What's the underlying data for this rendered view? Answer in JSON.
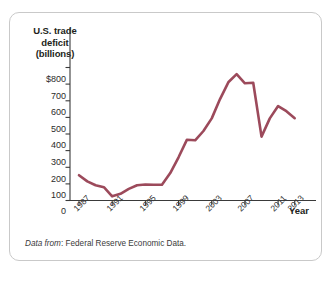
{
  "figure": {
    "source_note_prefix": "Data from",
    "source_note_sep": ":",
    "source_note_body": "Federal Reserve Economic Data."
  },
  "chart_data": {
    "type": "line",
    "title": "",
    "ylabel_lines": [
      "U.S. trade",
      "deficit",
      "(billions)"
    ],
    "ylabel": "U.S. trade deficit (billions)",
    "xlabel": "Year",
    "ylim": [
      0,
      800
    ],
    "xlim": [
      1987,
      2013
    ],
    "grid": false,
    "legend": "none",
    "line_color": "#9c4a5b",
    "ytick_labels": [
      "$800",
      "700",
      "600",
      "500",
      "400",
      "300",
      "200",
      "100",
      "0"
    ],
    "ytick_values": [
      800,
      700,
      600,
      500,
      400,
      300,
      200,
      100,
      0
    ],
    "xtick_labels": [
      "1987",
      "1991",
      "1995",
      "1999",
      "2003",
      "2007",
      "2011",
      "2013"
    ],
    "xtick_values": [
      1987,
      1991,
      1995,
      1999,
      2003,
      2007,
      2011,
      2013
    ],
    "x": [
      1987,
      1988,
      1989,
      1990,
      1991,
      1992,
      1993,
      1994,
      1995,
      1996,
      1997,
      1998,
      1999,
      2000,
      2001,
      2002,
      2003,
      2004,
      2005,
      2006,
      2007,
      2008,
      2009,
      2010,
      2011,
      2012,
      2013
    ],
    "values": [
      152,
      115,
      92,
      80,
      25,
      40,
      70,
      92,
      96,
      95,
      95,
      165,
      260,
      365,
      362,
      418,
      494,
      610,
      711,
      760,
      705,
      708,
      384,
      494,
      568,
      537,
      495
    ],
    "series": [
      {
        "name": "U.S. trade deficit",
        "values": [
          152,
          115,
          92,
          80,
          25,
          40,
          70,
          92,
          96,
          95,
          95,
          165,
          260,
          365,
          362,
          418,
          494,
          610,
          711,
          760,
          705,
          708,
          384,
          494,
          568,
          537,
          495
        ]
      }
    ],
    "units": "billions of dollars"
  }
}
